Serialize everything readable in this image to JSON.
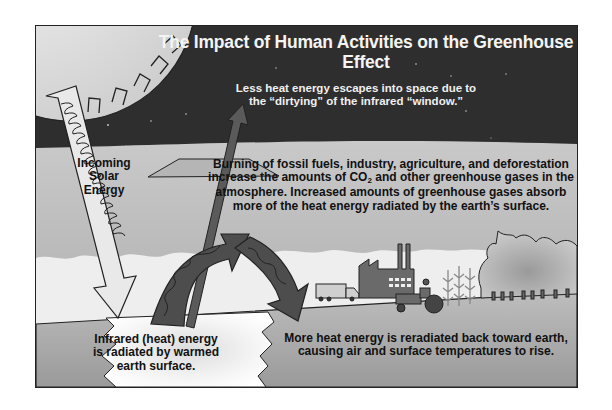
{
  "diagram": {
    "title": "The Impact of Human Activities on the Greenhouse Effect",
    "labels": {
      "escape_line1": "Less heat energy escapes into space due to",
      "escape_line2": "the “dirtying” of the infrared “window.”",
      "solar_line1": "Incoming",
      "solar_line2": "Solar",
      "solar_line3": "Energy",
      "burning_line1": "Burning of fossil fuels, industry, agriculture, and deforestation",
      "burning_line2_a": "increase the amounts of CO",
      "burning_line2_sub": "2",
      "burning_line2_b": " and other greenhouse gases in the",
      "burning_line3": "atmosphere. Increased amounts of greenhouse gases absorb",
      "burning_line4": "more of the heat energy radiated by the earth’s surface.",
      "infrared_line1": "Infrared (heat) energy",
      "infrared_line2": "is radiated by warmed",
      "infrared_line3": "earth surface.",
      "reradiated_line1": "More heat energy is reradiated back toward earth,",
      "reradiated_line2": "causing air and surface temperatures to rise."
    },
    "elements": [
      "sun",
      "incoming-solar-arrow",
      "infrared-window-plane",
      "escaping-arrow",
      "outgoing-infrared-arrow",
      "reradiated-arrow",
      "clouds",
      "truck",
      "factory",
      "tractor",
      "crops",
      "forest",
      "ground",
      "warmed-surface"
    ],
    "colors": {
      "space": "#2e2e2e",
      "atmosphere": "#b9b9b9",
      "cloud": "#eeeeee",
      "ground": "#a8a8a8",
      "arrow_dark": "#4a4a4a",
      "sun": "#e6e6e6"
    }
  }
}
